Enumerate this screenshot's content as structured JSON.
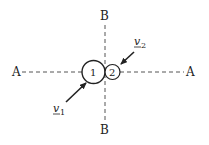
{
  "diagram": {
    "axes": {
      "horizontal": {
        "left_label": "A",
        "right_label": "A"
      },
      "vertical": {
        "top_label": "B",
        "bottom_label": "B"
      }
    },
    "bodies": [
      {
        "label": "1",
        "size": "large"
      },
      {
        "label": "2",
        "size": "small"
      }
    ],
    "velocities": [
      {
        "symbol": "v",
        "subscript": "1",
        "direction": "toward body 1 from lower-left"
      },
      {
        "symbol": "v",
        "subscript": "2",
        "direction": "toward body 2 from upper-right"
      }
    ]
  },
  "colors": {
    "line": "#222222",
    "background": "#ffffff"
  }
}
